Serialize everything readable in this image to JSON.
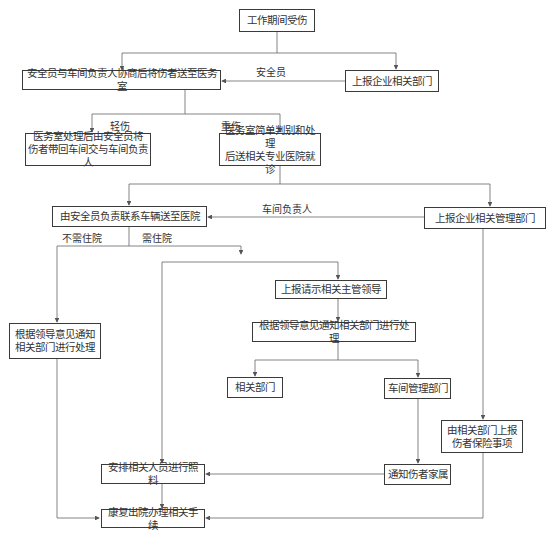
{
  "nodes": {
    "start": "工作期间受伤",
    "send_clinic": "安全员与车间负责人协商后将伤者送至医务室",
    "report_dept": "上报企业相关部门",
    "light_handle": "医务室处理后由安全员将\n伤者带回车间交与车间负责人",
    "severe_handle": "医务室简单判别和处理\n后送相关专业医院就诊",
    "send_hospital": "由安全员负责联系车辆送至医院",
    "report_mgmt": "上报企业相关管理部门",
    "notify_by_leader_left": "根据领导意见通知\n相关部门进行处理",
    "report_leader": "上报请示相关主管领导",
    "notify_by_leader": "根据领导意见通知相关部门进行处理",
    "related_dept": "相关部门",
    "workshop_mgmt": "车间管理部门",
    "insurance": "由相关部门上报\n伤者保险事项",
    "arrange_care": "安排相关人员进行照料",
    "notify_family": "通知伤者家属",
    "discharge": "康复出院办理相关手续"
  },
  "edge_labels": {
    "safety_officer": "安全员",
    "light_injury": "轻伤",
    "severe_injury": "重伤",
    "workshop_head": "车间负责人",
    "no_hospitalization": "不需住院",
    "hospitalization": "需住院"
  },
  "colors": {
    "line": "#555555",
    "border": "#3a3a3a",
    "text": "#333333"
  }
}
